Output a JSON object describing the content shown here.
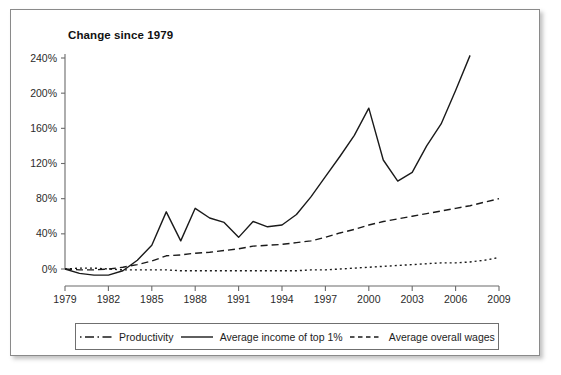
{
  "figure": {
    "title": "Change since 1979"
  },
  "chart_data": {
    "type": "line",
    "title": "Change since 1979",
    "xlabel": "",
    "ylabel": "",
    "xlim": [
      1979,
      2009
    ],
    "ylim": [
      -20,
      250
    ],
    "grid": false,
    "legend_position": "bottom",
    "x_ticks": [
      "1979",
      "1982",
      "1985",
      "1988",
      "1991",
      "1994",
      "1997",
      "2000",
      "2003",
      "2006",
      "2009"
    ],
    "y_ticks": [
      "0%",
      "40%",
      "80%",
      "120%",
      "160%",
      "200%",
      "240%"
    ],
    "y_tick_values": [
      0,
      40,
      80,
      120,
      160,
      200,
      240
    ],
    "x": [
      1979,
      1980,
      1981,
      1982,
      1983,
      1984,
      1985,
      1986,
      1987,
      1988,
      1989,
      1990,
      1991,
      1992,
      1993,
      1994,
      1995,
      1996,
      1997,
      1998,
      1999,
      2000,
      2001,
      2002,
      2003,
      2004,
      2005,
      2006,
      2007,
      2008,
      2009
    ],
    "series": [
      {
        "name": "Productivity",
        "style": "dashdot",
        "color": "#1a1a1a",
        "x": [
          1979,
          1980,
          1981,
          1982,
          1983,
          1984,
          1985,
          1986,
          1987,
          1988,
          1989,
          1990,
          1991,
          1992,
          1993,
          1994,
          1995,
          1996,
          1997,
          1998,
          1999,
          2000,
          2001,
          2002,
          2003,
          2004,
          2005,
          2006,
          2007,
          2008,
          2009
        ],
        "values": [
          0,
          1,
          1,
          0,
          -1,
          -1,
          -1,
          -1,
          -2,
          -2,
          -2,
          -2,
          -2,
          -2,
          -2,
          -2,
          -2,
          -1,
          -1,
          0,
          1,
          2,
          3,
          4,
          5,
          6,
          7,
          7,
          8,
          10,
          13
        ]
      },
      {
        "name": "Average income of top 1%",
        "style": "solid",
        "color": "#1a1a1a",
        "x": [
          1979,
          1980,
          1981,
          1982,
          1983,
          1984,
          1985,
          1986,
          1987,
          1988,
          1989,
          1990,
          1991,
          1992,
          1993,
          1994,
          1995,
          1996,
          1997,
          1998,
          1999,
          2000,
          2001,
          2002,
          2003,
          2004,
          2005,
          2006,
          2007
        ],
        "values": [
          0,
          -5,
          -7,
          -7,
          -2,
          10,
          27,
          65,
          32,
          69,
          58,
          53,
          36,
          54,
          48,
          50,
          62,
          82,
          105,
          128,
          152,
          183,
          124,
          100,
          110,
          140,
          165,
          203,
          243
        ]
      },
      {
        "name": "Average overall wages",
        "style": "dashed",
        "color": "#1a1a1a",
        "x": [
          1979,
          1980,
          1981,
          1982,
          1983,
          1984,
          1985,
          1986,
          1987,
          1988,
          1989,
          1990,
          1991,
          1992,
          1993,
          1994,
          1995,
          1996,
          1997,
          1998,
          1999,
          2000,
          2001,
          2002,
          2003,
          2004,
          2005,
          2006,
          2007,
          2008,
          2009
        ],
        "values": [
          0,
          -1,
          -1,
          0,
          2,
          5,
          9,
          15,
          16,
          18,
          19,
          21,
          23,
          26,
          27,
          28,
          30,
          32,
          36,
          41,
          45,
          50,
          54,
          57,
          60,
          63,
          66,
          69,
          72,
          76,
          80
        ]
      }
    ]
  },
  "legend": {
    "items": [
      {
        "label": "Productivity",
        "style": "dashdot"
      },
      {
        "label": "Average income of top 1%",
        "style": "solid"
      },
      {
        "label": "Average overall wages",
        "style": "dashed"
      }
    ]
  }
}
